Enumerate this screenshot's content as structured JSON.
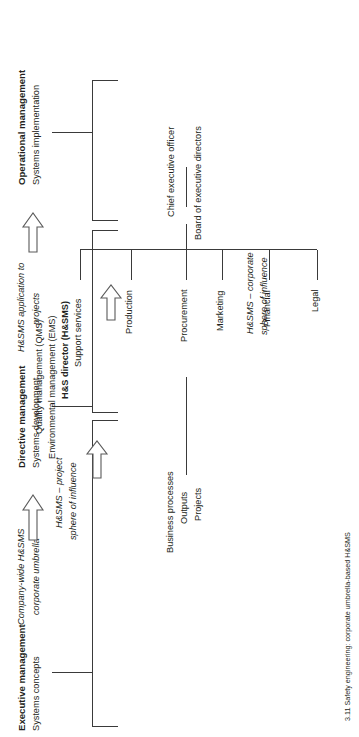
{
  "figure": {
    "caption_number": "3.11",
    "caption_text": "Safety engineering: corporate umbrella-based H&SMS",
    "caption_full": "3.11 Safety engineering: corporate umbrella-based H&SMS"
  },
  "management_levels": [
    {
      "id": "executive",
      "title": "Executive management",
      "subtitle": "Systems concepts",
      "note_line1": "Company-wide H&SMS",
      "note_line2": "corporate umbrella"
    },
    {
      "id": "directive",
      "title": "Directive management",
      "subtitle": "Systems development",
      "note_line1": "H&SMS application to",
      "note_line2": "projects"
    },
    {
      "id": "operational",
      "title": "Operational management",
      "subtitle": "Systems implementation",
      "note_line1": "",
      "note_line2": ""
    }
  ],
  "org_chart": {
    "top_role": "Chief executive officer",
    "board": "Board of executive directors",
    "departments": [
      "Legal",
      "Financial",
      "Marketing",
      "Procurement",
      "Production",
      "Support services"
    ],
    "hs_director": "H&S director (H&SMS)",
    "hs_director_systems": [
      "Environmental management (EMS)",
      "Quality management (QMS)"
    ]
  },
  "spheres": {
    "corporate_line1": "H&SMS – corporate",
    "corporate_line2": "sphere of influence",
    "project_line1": "H&SMS – project",
    "project_line2": "sphere of influence"
  },
  "outputs": {
    "items": [
      "Business processes",
      "Outputs",
      "Projects"
    ]
  },
  "icons": {
    "arrow_executive": "block-arrow-right-icon",
    "arrow_directive": "block-arrow-right-icon",
    "arrow_production": "block-arrow-right-icon",
    "arrow_hsdirector": "block-arrow-right-icon"
  },
  "colors": {
    "line": "#3a3a3a",
    "text": "#231f20",
    "arrow_stroke": "#5a5a5a",
    "arrow_fill": "#ffffff"
  }
}
